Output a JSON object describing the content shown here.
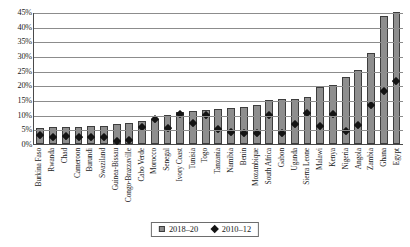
{
  "chart_data": {
    "type": "bar",
    "title": "",
    "subtitle": "",
    "xlabel": "",
    "ylabel": "",
    "ylim": [
      0,
      45
    ],
    "ytick_labels": [
      "0%",
      "5%",
      "10%",
      "15%",
      "20%",
      "25%",
      "30%",
      "35%",
      "40%",
      "45%"
    ],
    "ytick_values": [
      0,
      5,
      10,
      15,
      20,
      25,
      30,
      35,
      40,
      45
    ],
    "grid": true,
    "legend_position": "bottom",
    "categories": [
      "Burkina Faso",
      "Rwanda",
      "Chad",
      "Cameroon",
      "Burundi",
      "Swaziland",
      "Guinea-Bissau",
      "Congo-Brazzaville",
      "Cabo Verde",
      "Morocco",
      "Senegal",
      "Ivory Coast",
      "Tunisia",
      "Togo",
      "Tanzania",
      "Namibia",
      "Benin",
      "Mozambique",
      "South Africa",
      "Gabon",
      "Uganda",
      "Sierra Leone",
      "Malawi",
      "Kenya",
      "Nigeria",
      "Angola",
      "Zambia",
      "Ghana",
      "Egypt"
    ],
    "series": [
      {
        "name": "2018–20",
        "marker": "bar",
        "color": "#8e8e8e",
        "values": [
          5.5,
          5.8,
          5.8,
          5.8,
          6.0,
          6.2,
          6.8,
          7.3,
          8.0,
          8.6,
          10.0,
          10.8,
          11.2,
          11.5,
          11.8,
          12.2,
          12.5,
          13.3,
          15.0,
          15.3,
          15.3,
          16.0,
          19.3,
          20.2,
          22.8,
          25.3,
          31.0,
          43.5,
          45.0
        ]
      },
      {
        "name": "2010–12",
        "marker": "diamond",
        "color": "#141414",
        "values": [
          3.0,
          2.2,
          2.5,
          2.2,
          2.3,
          2.3,
          1.0,
          1.2,
          5.8,
          8.5,
          5.5,
          10.0,
          7.2,
          9.8,
          5.0,
          4.2,
          3.6,
          3.8,
          9.8,
          3.6,
          6.8,
          10.5,
          6.2,
          10.0,
          4.4,
          6.3,
          13.2,
          18.0,
          21.5
        ]
      }
    ],
    "legend": [
      {
        "label": "2018–20",
        "swatch": "square"
      },
      {
        "label": "2010–12",
        "swatch": "diamond"
      }
    ]
  }
}
